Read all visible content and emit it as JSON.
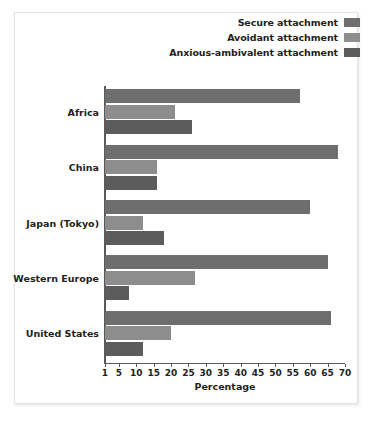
{
  "chart_data": {
    "type": "bar",
    "orientation": "horizontal",
    "title": "",
    "xlabel": "Percentage",
    "ylabel": "",
    "xlim": [
      1,
      70
    ],
    "grid": false,
    "legend_position": "top-right",
    "xticks": [
      1,
      5,
      10,
      15,
      20,
      25,
      30,
      35,
      40,
      45,
      50,
      55,
      60,
      65,
      70
    ],
    "xticklabels": [
      "1",
      "5",
      "10",
      "15",
      "20",
      "25",
      "30",
      "35",
      "40",
      "45",
      "50",
      "55",
      "60",
      "65",
      "70"
    ],
    "categories": [
      "Africa",
      "China",
      "Japan (Tokyo)",
      "Western Europe",
      "United States"
    ],
    "series": [
      {
        "name": "Secure attachment",
        "color": "#6e6e6e",
        "values": [
          57,
          68,
          60,
          65,
          66
        ]
      },
      {
        "name": "Avoidant attachment",
        "color": "#8d8d8d",
        "values": [
          21,
          16,
          12,
          27,
          20
        ]
      },
      {
        "name": "Anxious-ambivalent attachment",
        "color": "#5c5c5c",
        "values": [
          26,
          16,
          18,
          8,
          12
        ]
      }
    ]
  },
  "legend": {
    "items": [
      {
        "label": "Secure attachment",
        "color": "#6e6e6e"
      },
      {
        "label": "Avoidant attachment",
        "color": "#8d8d8d"
      },
      {
        "label": "Anxious-ambivalent attachment",
        "color": "#5c5c5c"
      }
    ]
  },
  "axis": {
    "xlabel": "Percentage"
  }
}
